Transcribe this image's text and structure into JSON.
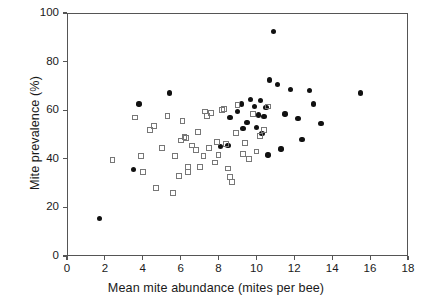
{
  "chart_data": {
    "type": "scatter",
    "title": "",
    "xlabel": "Mean mite abundance (mites per bee)",
    "ylabel": "Mite prevalence (%)",
    "xlim": [
      0,
      18
    ],
    "ylim": [
      0,
      100
    ],
    "xticks": [
      0,
      2,
      4,
      6,
      8,
      10,
      12,
      14,
      16,
      18
    ],
    "yticks": [
      0,
      20,
      40,
      60,
      80,
      100
    ],
    "grid": false,
    "legend": "none",
    "series": [
      {
        "name": "filled-circles",
        "marker": "filled circle",
        "color": "#111111",
        "points": [
          [
            1.7,
            15.5
          ],
          [
            3.5,
            35.5
          ],
          [
            3.8,
            62.5
          ],
          [
            5.4,
            67.0
          ],
          [
            8.1,
            45.0
          ],
          [
            8.5,
            45.5
          ],
          [
            8.6,
            57.0
          ],
          [
            9.0,
            59.5
          ],
          [
            9.2,
            62.5
          ],
          [
            9.3,
            52.5
          ],
          [
            9.5,
            55.0
          ],
          [
            9.7,
            64.5
          ],
          [
            9.9,
            61.5
          ],
          [
            10.0,
            53.0
          ],
          [
            10.1,
            58.0
          ],
          [
            10.2,
            64.0
          ],
          [
            10.3,
            50.5
          ],
          [
            10.4,
            57.5
          ],
          [
            10.5,
            61.0
          ],
          [
            10.6,
            41.5
          ],
          [
            10.7,
            72.5
          ],
          [
            10.9,
            92.5
          ],
          [
            11.1,
            70.5
          ],
          [
            11.3,
            44.0
          ],
          [
            11.5,
            58.5
          ],
          [
            11.8,
            68.5
          ],
          [
            12.2,
            56.5
          ],
          [
            12.4,
            48.0
          ],
          [
            12.8,
            68.0
          ],
          [
            13.0,
            62.5
          ],
          [
            13.4,
            54.5
          ],
          [
            15.5,
            67.0
          ]
        ]
      },
      {
        "name": "open-squares",
        "marker": "open square",
        "color": "#777777",
        "points": [
          [
            2.4,
            39.5
          ],
          [
            3.6,
            57.0
          ],
          [
            3.9,
            41.0
          ],
          [
            4.0,
            34.5
          ],
          [
            4.4,
            52.0
          ],
          [
            4.6,
            53.5
          ],
          [
            4.7,
            28.0
          ],
          [
            5.0,
            44.5
          ],
          [
            5.3,
            57.5
          ],
          [
            5.6,
            26.0
          ],
          [
            5.7,
            41.0
          ],
          [
            5.9,
            33.0
          ],
          [
            6.0,
            47.5
          ],
          [
            6.1,
            55.5
          ],
          [
            6.2,
            49.0
          ],
          [
            6.3,
            48.5
          ],
          [
            6.4,
            34.5
          ],
          [
            6.4,
            36.5
          ],
          [
            6.6,
            45.5
          ],
          [
            6.8,
            43.5
          ],
          [
            6.9,
            51.0
          ],
          [
            7.0,
            36.5
          ],
          [
            7.2,
            41.0
          ],
          [
            7.3,
            59.5
          ],
          [
            7.4,
            57.5
          ],
          [
            7.5,
            44.5
          ],
          [
            7.6,
            59.0
          ],
          [
            7.8,
            38.5
          ],
          [
            7.9,
            47.0
          ],
          [
            8.0,
            41.5
          ],
          [
            8.2,
            60.0
          ],
          [
            8.3,
            60.5
          ],
          [
            8.4,
            46.0
          ],
          [
            8.5,
            36.0
          ],
          [
            8.6,
            32.5
          ],
          [
            8.7,
            30.5
          ],
          [
            8.9,
            50.5
          ],
          [
            9.0,
            62.0
          ],
          [
            9.3,
            42.0
          ],
          [
            9.4,
            46.5
          ],
          [
            9.6,
            40.0
          ],
          [
            9.8,
            58.5
          ],
          [
            10.0,
            43.0
          ],
          [
            10.2,
            49.5
          ],
          [
            10.4,
            52.0
          ],
          [
            10.6,
            61.5
          ]
        ]
      }
    ]
  }
}
